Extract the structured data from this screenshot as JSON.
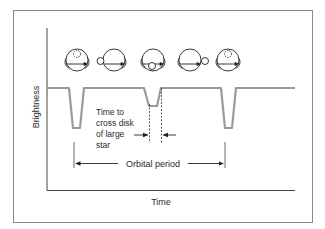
{
  "diagram": {
    "axes": {
      "y_label": "Brightness",
      "x_label": "Time"
    },
    "annotations": {
      "crossing_time_lines": [
        "Time to",
        "cross disk",
        "of large",
        "star"
      ],
      "orbital_period": "Orbital period"
    },
    "star_positions": [
      {
        "id": "pos1",
        "description": "small star behind large star (eclipsed, dashed)"
      },
      {
        "id": "pos2",
        "description": "small star left of large star"
      },
      {
        "id": "pos3",
        "description": "small star in front of large star (transit)"
      },
      {
        "id": "pos4",
        "description": "small star right of large star"
      },
      {
        "id": "pos5",
        "description": "small star behind large star (eclipsed, dashed)"
      }
    ],
    "light_curve": {
      "baseline": "constant brightness",
      "dips": [
        {
          "type": "primary",
          "depth": "deep"
        },
        {
          "type": "secondary",
          "depth": "shallow"
        },
        {
          "type": "primary",
          "depth": "deep"
        }
      ]
    },
    "colors": {
      "curve": "#9a9a9a",
      "lines": "#333333",
      "frame": "#888888",
      "background": "#ffffff"
    }
  }
}
